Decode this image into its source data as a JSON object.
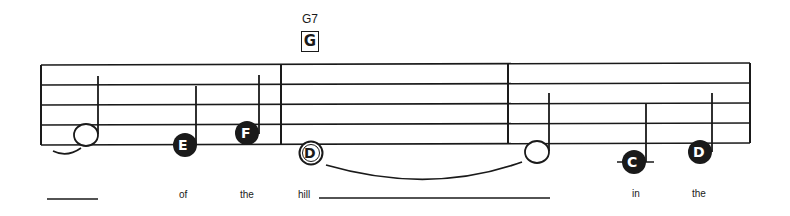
{
  "chord": {
    "name": "G7",
    "box_label": "G"
  },
  "notes": [
    {
      "letter": "",
      "type": "half"
    },
    {
      "letter": "E",
      "type": "quarter"
    },
    {
      "letter": "F",
      "type": "quarter"
    },
    {
      "letter": "D",
      "type": "half-tied"
    },
    {
      "letter": "",
      "type": "half-tied"
    },
    {
      "letter": "C",
      "type": "quarter"
    },
    {
      "letter": "D",
      "type": "quarter"
    }
  ],
  "lyrics": {
    "w1": "of",
    "w2": "the",
    "w3": "hill",
    "w4": "in",
    "w5": "the"
  },
  "colors": {
    "ink": "#1a1a1a",
    "background": "#ffffff"
  }
}
